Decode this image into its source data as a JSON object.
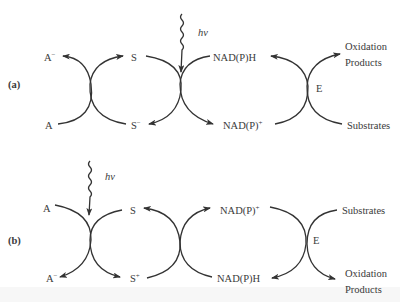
{
  "diagram": {
    "panel_a": {
      "label": "(a)",
      "light": "hν",
      "left_top": "A",
      "left_top_charge": "−",
      "left_bottom": "A",
      "mid_top": "S",
      "mid_bottom": "S",
      "mid_bottom_charge": "−",
      "nad_top": "NAD(P)H",
      "nad_bottom": "NAD(P)",
      "nad_bottom_charge": "+",
      "enzyme": "E",
      "out_top_1": "Oxidation",
      "out_top_2": "Products",
      "out_bottom": "Substrates"
    },
    "panel_b": {
      "label": "(b)",
      "light": "hν",
      "left_top": "A",
      "left_bottom": "A",
      "left_bottom_charge": "−",
      "mid_top": "S",
      "mid_bottom": "S",
      "mid_bottom_charge": "+",
      "nad_top": "NAD(P)",
      "nad_top_charge": "+",
      "nad_bottom": "NAD(P)H",
      "enzyme": "E",
      "out_top": "Substrates",
      "out_bottom_1": "Oxidation",
      "out_bottom_2": "Products"
    },
    "colors": {
      "line": "#333333",
      "text": "#3a3a3a",
      "background": "#ffffff"
    }
  }
}
